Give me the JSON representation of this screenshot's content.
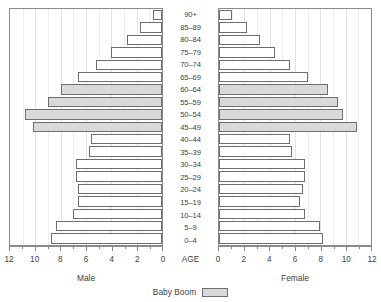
{
  "chart_data": {
    "type": "bar",
    "subtype": "population-pyramid",
    "title": "",
    "xlabel": "",
    "ylabel": "AGE",
    "categories": [
      "0–4",
      "5–9",
      "10–14",
      "15–19",
      "20–24",
      "25–29",
      "30–34",
      "35–39",
      "40–44",
      "45–49",
      "50–54",
      "55–59",
      "60–64",
      "65–69",
      "70–74",
      "75–79",
      "80–84",
      "85–89",
      "90+"
    ],
    "series": [
      {
        "name": "Male",
        "side": "left",
        "values": [
          8.8,
          8.4,
          7.0,
          6.6,
          6.6,
          6.8,
          6.8,
          5.8,
          5.6,
          10.2,
          10.8,
          9.0,
          8.0,
          6.6,
          5.2,
          4.0,
          2.8,
          1.7,
          0.7
        ]
      },
      {
        "name": "Female",
        "side": "right",
        "values": [
          8.2,
          8.0,
          6.8,
          6.4,
          6.6,
          6.8,
          6.8,
          5.8,
          5.6,
          10.9,
          9.8,
          9.4,
          8.6,
          7.0,
          5.6,
          4.4,
          3.2,
          2.2,
          1.0
        ]
      }
    ],
    "xlim": [
      0,
      12
    ],
    "xticks": [
      0,
      2,
      4,
      6,
      8,
      10,
      12
    ],
    "xticklabels": [
      "0",
      "2",
      "4",
      "6",
      "8",
      "10",
      "12"
    ],
    "grid": "vertical",
    "highlight": {
      "label": "Baby Boom",
      "categories": [
        "45–49",
        "50–54",
        "55–59",
        "60–64"
      ],
      "color": "#d9d9d9"
    },
    "legend_position": "bottom-center"
  },
  "axis": {
    "center_label": "AGE",
    "male_label": "Male",
    "female_label": "Female"
  },
  "legend": {
    "baby_boom_label": "Baby Boom"
  },
  "colors": {
    "bar_fill": "#ffffff",
    "bar_stroke": "#6e6e6e",
    "boom_fill": "#d9d9d9",
    "grid": "#e3e3e3",
    "axis": "#8a8a8a",
    "text": "#3f3f3f"
  }
}
